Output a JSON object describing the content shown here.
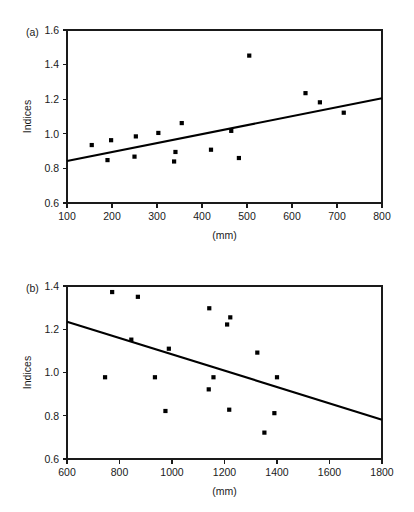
{
  "figure": {
    "background_color": "#ffffff",
    "foreground_color": "#1a1a1a",
    "marker_color": "#000000",
    "panel_count": 2
  },
  "chart_data": [
    {
      "type": "scatter",
      "panel_label": "(a)",
      "title": "",
      "xlabel": "(mm)",
      "ylabel": "Indices",
      "xlim": [
        100,
        800
      ],
      "ylim": [
        0.6,
        1.6
      ],
      "xticks": [
        100,
        200,
        300,
        400,
        500,
        600,
        700,
        800
      ],
      "xticklabels": [
        "100",
        "200",
        "300",
        "400",
        "500",
        "600",
        "700",
        "800"
      ],
      "yticks": [
        0.6,
        0.8,
        1.0,
        1.2,
        1.4,
        1.6
      ],
      "yticklabels": [
        "0.6",
        "0.8",
        "1.0",
        "1.2",
        "1.4",
        "1.6"
      ],
      "grid": false,
      "legend": "none",
      "marker": "square",
      "points": [
        {
          "x": 155,
          "y": 0.935
        },
        {
          "x": 190,
          "y": 0.848
        },
        {
          "x": 198,
          "y": 0.963
        },
        {
          "x": 250,
          "y": 0.868
        },
        {
          "x": 253,
          "y": 0.985
        },
        {
          "x": 303,
          "y": 1.005
        },
        {
          "x": 338,
          "y": 0.84
        },
        {
          "x": 341,
          "y": 0.895
        },
        {
          "x": 355,
          "y": 1.062
        },
        {
          "x": 420,
          "y": 0.908
        },
        {
          "x": 465,
          "y": 1.017
        },
        {
          "x": 482,
          "y": 0.86
        },
        {
          "x": 505,
          "y": 1.452
        },
        {
          "x": 630,
          "y": 1.235
        },
        {
          "x": 662,
          "y": 1.182
        },
        {
          "x": 715,
          "y": 1.122
        }
      ],
      "trend_line": {
        "type": "linear-fit",
        "x_start": 100,
        "y_start": 0.843,
        "x_end": 800,
        "y_end": 1.205
      }
    },
    {
      "type": "scatter",
      "panel_label": "(b)",
      "title": "",
      "xlabel": "(mm)",
      "ylabel": "Indices",
      "xlim": [
        600,
        1800
      ],
      "ylim": [
        0.6,
        1.4
      ],
      "xticks": [
        600,
        800,
        1000,
        1200,
        1400,
        1600,
        1800
      ],
      "xticklabels": [
        "600",
        "800",
        "1000",
        "1200",
        "1400",
        "1600",
        "1800"
      ],
      "yticks": [
        0.6,
        0.8,
        1.0,
        1.2,
        1.4
      ],
      "yticklabels": [
        "0.6",
        "0.8",
        "1.0",
        "1.2",
        "1.4"
      ],
      "grid": false,
      "legend": "none",
      "marker": "square",
      "points": [
        {
          "x": 745,
          "y": 0.978
        },
        {
          "x": 772,
          "y": 1.372
        },
        {
          "x": 845,
          "y": 1.152
        },
        {
          "x": 870,
          "y": 1.35
        },
        {
          "x": 935,
          "y": 0.978
        },
        {
          "x": 975,
          "y": 0.822
        },
        {
          "x": 988,
          "y": 1.11
        },
        {
          "x": 1140,
          "y": 0.922
        },
        {
          "x": 1142,
          "y": 1.297
        },
        {
          "x": 1158,
          "y": 0.978
        },
        {
          "x": 1210,
          "y": 1.222
        },
        {
          "x": 1218,
          "y": 0.828
        },
        {
          "x": 1222,
          "y": 1.255
        },
        {
          "x": 1325,
          "y": 1.092
        },
        {
          "x": 1352,
          "y": 0.722
        },
        {
          "x": 1390,
          "y": 0.812
        },
        {
          "x": 1400,
          "y": 0.978
        }
      ],
      "trend_line": {
        "type": "linear-fit",
        "x_start": 600,
        "y_start": 1.235,
        "x_end": 1800,
        "y_end": 0.782
      }
    }
  ]
}
